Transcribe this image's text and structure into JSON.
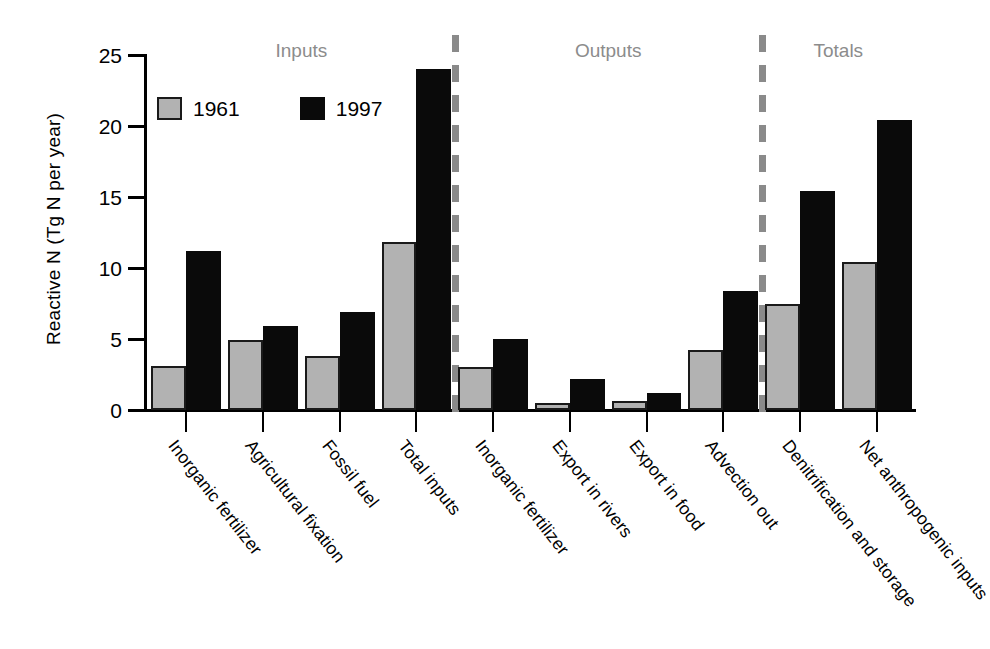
{
  "chart_data": {
    "type": "bar",
    "title": "",
    "xlabel": "",
    "ylabel": "Reactive N (Tg N per year)",
    "ylim": [
      0,
      25
    ],
    "yticks": [
      0,
      5,
      10,
      15,
      20,
      25
    ],
    "grid": false,
    "legend_position": "top-left",
    "categories": [
      "Inorganic fertilizer",
      "Agricultural fixation",
      "Fossil fuel",
      "Total inputs",
      "Inorganic fertilizer",
      "Export in rivers",
      "Export in food",
      "Advection out",
      "Denitrification and storage",
      "Net anthropogenic inputs"
    ],
    "series": [
      {
        "name": "1961",
        "color": "#b2b2b2",
        "values": [
          3.1,
          4.9,
          3.8,
          11.8,
          3.0,
          0.5,
          0.6,
          4.2,
          7.5,
          10.4
        ]
      },
      {
        "name": "1997",
        "color": "#0a0a0a",
        "values": [
          11.2,
          5.9,
          6.9,
          24.0,
          5.0,
          2.2,
          1.2,
          8.4,
          15.4,
          20.4
        ]
      }
    ],
    "sections": [
      {
        "label": "Inputs",
        "start_index": 0,
        "end_index": 3
      },
      {
        "label": "Outputs",
        "start_index": 4,
        "end_index": 7
      },
      {
        "label": "Totals",
        "start_index": 8,
        "end_index": 9
      }
    ],
    "dividers_after_index": [
      3,
      7
    ]
  },
  "legend": {
    "items": [
      {
        "label": "1961",
        "swatch": "gray-square-swatch"
      },
      {
        "label": "1997",
        "swatch": "black-square-swatch"
      }
    ]
  }
}
